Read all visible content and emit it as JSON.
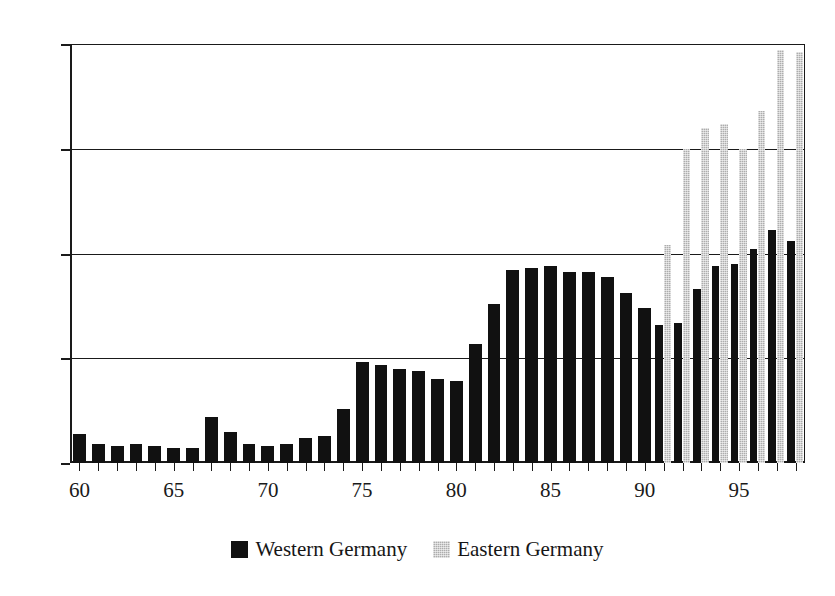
{
  "chart_data": {
    "type": "bar",
    "title": "",
    "subtitle": "",
    "xlabel": "",
    "ylabel": "",
    "ylim": [
      0,
      20
    ],
    "yticks": [
      0,
      5,
      10,
      15,
      20
    ],
    "xtick_labels": [
      "60",
      "65",
      "70",
      "75",
      "80",
      "85",
      "90",
      "95"
    ],
    "xtick_years": [
      60,
      65,
      70,
      75,
      80,
      85,
      90,
      95
    ],
    "grid": "horizontal",
    "legend_position": "bottom-center",
    "categories": [
      "60",
      "61",
      "62",
      "63",
      "64",
      "65",
      "66",
      "67",
      "68",
      "69",
      "70",
      "71",
      "72",
      "73",
      "74",
      "75",
      "76",
      "77",
      "78",
      "79",
      "80",
      "81",
      "82",
      "83",
      "84",
      "85",
      "86",
      "87",
      "88",
      "89",
      "90",
      "91",
      "92",
      "93",
      "94",
      "95",
      "96",
      "97",
      "98"
    ],
    "series": [
      {
        "name": "Western Germany",
        "color": "#111111",
        "values": [
          1.4,
          0.9,
          0.8,
          0.9,
          0.8,
          0.7,
          0.7,
          2.2,
          1.5,
          0.9,
          0.8,
          0.9,
          1.2,
          1.3,
          2.6,
          4.8,
          4.7,
          4.5,
          4.4,
          4.0,
          3.9,
          5.7,
          7.6,
          9.2,
          9.3,
          9.4,
          9.1,
          9.1,
          8.9,
          8.1,
          7.4,
          6.6,
          6.7,
          8.3,
          9.4,
          9.5,
          10.2,
          11.1,
          10.6
        ]
      },
      {
        "name": "Eastern Germany",
        "color": "#adadad",
        "values": [
          null,
          null,
          null,
          null,
          null,
          null,
          null,
          null,
          null,
          null,
          null,
          null,
          null,
          null,
          null,
          null,
          null,
          null,
          null,
          null,
          null,
          null,
          null,
          null,
          null,
          null,
          null,
          null,
          null,
          null,
          null,
          10.4,
          15.0,
          16.0,
          16.2,
          15.0,
          16.8,
          19.7,
          19.6
        ]
      }
    ],
    "legend": [
      {
        "label": "Western Germany",
        "swatch": "black-square",
        "color": "#111111"
      },
      {
        "label": "Eastern Germany",
        "swatch": "gray-square",
        "color": "#adadad"
      }
    ]
  }
}
